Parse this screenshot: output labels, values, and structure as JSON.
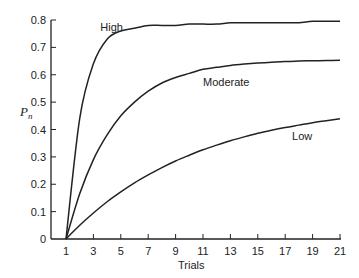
{
  "chart_data": {
    "type": "line",
    "title": "",
    "xlabel": "Trials",
    "ylabel": "P_n",
    "xlim": [
      1,
      21
    ],
    "ylim": [
      0,
      0.8
    ],
    "grid": false,
    "legend": "inline labels",
    "x_ticks": [
      1,
      3,
      5,
      7,
      9,
      11,
      13,
      15,
      17,
      19,
      21
    ],
    "y_ticks": [
      0,
      0.1,
      0.2,
      0.3,
      0.4,
      0.5,
      0.6,
      0.7,
      0.8
    ],
    "y_tick_labels": [
      "0",
      "0.1",
      "0.2",
      "0.3",
      "0.4",
      "0.5",
      "0.6",
      "0.7",
      "0.8"
    ],
    "x": [
      1,
      2,
      3,
      4,
      5,
      6,
      7,
      8,
      9,
      10,
      11,
      12,
      13,
      14,
      15,
      16,
      17,
      18,
      19,
      20,
      21
    ],
    "series": [
      {
        "name": "High",
        "values": [
          0,
          0.44,
          0.64,
          0.73,
          0.76,
          0.77,
          0.78,
          0.78,
          0.78,
          0.785,
          0.785,
          0.785,
          0.79,
          0.79,
          0.79,
          0.79,
          0.79,
          0.79,
          0.795,
          0.795,
          0.795
        ]
      },
      {
        "name": "Moderate",
        "values": [
          0,
          0.165,
          0.29,
          0.38,
          0.45,
          0.5,
          0.54,
          0.57,
          0.59,
          0.605,
          0.62,
          0.627,
          0.634,
          0.639,
          0.643,
          0.646,
          0.648,
          0.65,
          0.651,
          0.652,
          0.653
        ]
      },
      {
        "name": "Low",
        "values": [
          0,
          0.05,
          0.095,
          0.136,
          0.172,
          0.205,
          0.234,
          0.261,
          0.285,
          0.306,
          0.326,
          0.343,
          0.359,
          0.373,
          0.386,
          0.397,
          0.407,
          0.416,
          0.425,
          0.432,
          0.439
        ]
      }
    ],
    "annotations": [
      {
        "text": "High",
        "x": 3.5,
        "y": 0.76
      },
      {
        "text": "Moderate",
        "x": 11,
        "y": 0.56
      },
      {
        "text": "Low",
        "x": 17.5,
        "y": 0.36
      }
    ]
  }
}
